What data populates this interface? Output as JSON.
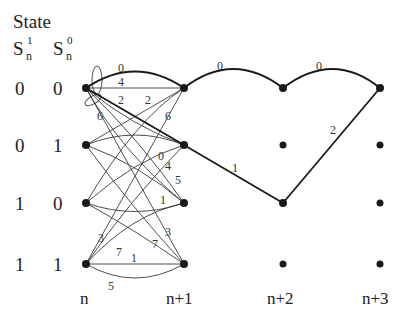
{
  "header": {
    "title": "State",
    "bit1": {
      "base": "S",
      "sup": "1",
      "sub": "n"
    },
    "bit0": {
      "base": "S",
      "sup": "0",
      "sub": "n"
    }
  },
  "states": [
    {
      "s1": "0",
      "s0": "0"
    },
    {
      "s1": "0",
      "s0": "1"
    },
    {
      "s1": "1",
      "s0": "0"
    },
    {
      "s1": "1",
      "s0": "1"
    }
  ],
  "time_labels": [
    "n",
    "n+1",
    "n+2",
    "n+3"
  ],
  "trellis_edge_labels": {
    "from_00": [
      "0",
      "4",
      "2",
      "2",
      "6",
      "6"
    ],
    "middle": [
      "0",
      "4",
      "5",
      "1"
    ],
    "from_11": [
      "3",
      "7",
      "1",
      "3",
      "7",
      "5"
    ]
  },
  "survivor_path_labels": {
    "n1_s00_to_n2_s00": "0",
    "n2_s00_to_n3_s00": "0",
    "n1_s01_to_n2_s10": "1",
    "n2_s10_to_n3_s00": "2"
  },
  "colors": {
    "line": "#3a3a3a",
    "bold_line": "#1a1a1a",
    "node": "#1a1a1a",
    "background": "#ffffff"
  }
}
